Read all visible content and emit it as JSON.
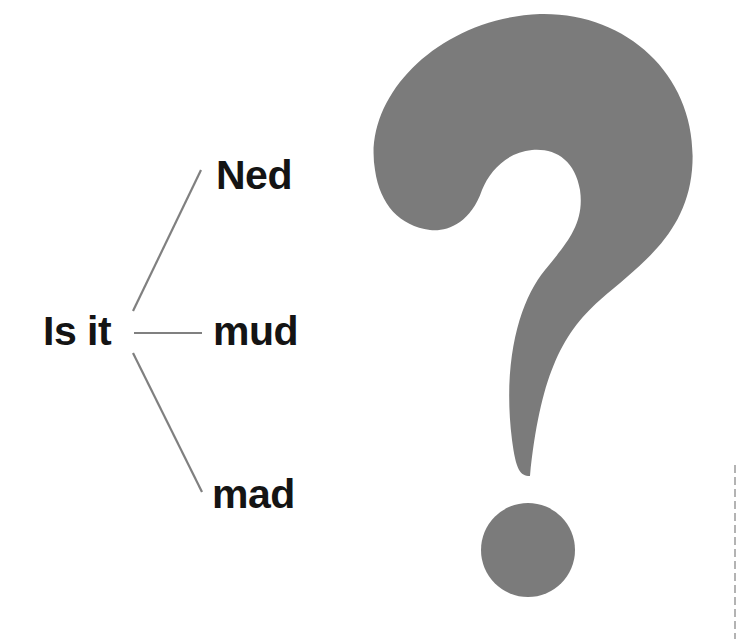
{
  "diagram": {
    "stem": {
      "label": "Is it"
    },
    "options": [
      {
        "label": "Ned"
      },
      {
        "label": "mud"
      },
      {
        "label": "mad"
      }
    ]
  },
  "icons": {
    "question_mark": "question-mark-icon"
  },
  "colors": {
    "text": "#141414",
    "lines": "#808080",
    "question_mark": "#7b7b7b",
    "background": "#ffffff"
  }
}
